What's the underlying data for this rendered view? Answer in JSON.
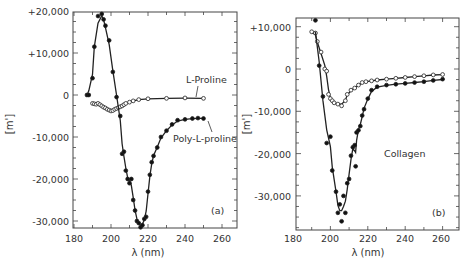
{
  "chart_data": [
    {
      "type": "line",
      "panel_label": "(a)",
      "title": "",
      "xlabel": "λ (nm)",
      "ylabel": "[m']",
      "xlim": [
        180,
        270
      ],
      "ylim": [
        -32000,
        20000
      ],
      "x_ticks": [
        180,
        200,
        220,
        240,
        260
      ],
      "x_tick_labels": [
        "180",
        "200",
        "220",
        "240",
        "260"
      ],
      "y_ticks": [
        20000,
        10000,
        0,
        -10000,
        -20000,
        -30000
      ],
      "y_tick_labels": [
        "+20,000",
        "+10,000",
        "0",
        "-10,000",
        "-20,000",
        "-30,000"
      ],
      "grid": false,
      "series": [
        {
          "name": "L-Proline",
          "marker": "open-circle",
          "x": [
            190,
            191,
            192,
            193,
            194,
            195,
            196,
            197,
            198,
            199,
            200,
            201,
            202,
            203,
            204,
            205,
            206,
            207,
            208,
            210,
            212,
            215,
            220,
            230,
            240,
            250
          ],
          "y": [
            -2000,
            -2100,
            -2200,
            -2000,
            -2300,
            -2600,
            -2900,
            -3100,
            -3400,
            -3600,
            -3800,
            -3700,
            -3400,
            -3200,
            -3000,
            -2800,
            -2600,
            -2300,
            -2000,
            -1700,
            -1400,
            -1100,
            -900,
            -800,
            -700,
            -800
          ]
        },
        {
          "name": "Poly-L-proline",
          "marker": "filled-circle",
          "x": [
            187,
            188,
            190,
            191,
            193,
            195,
            196,
            197,
            199,
            201,
            203,
            205,
            206,
            207,
            208,
            209,
            210,
            211,
            212,
            213,
            214,
            215,
            216,
            217,
            218,
            219,
            220,
            221,
            222,
            223,
            225,
            227,
            230,
            233,
            236,
            240,
            244,
            247,
            250
          ],
          "y": [
            0,
            0,
            4000,
            11500,
            18800,
            19300,
            18000,
            16500,
            13000,
            5500,
            -500,
            -5000,
            -14000,
            -13500,
            -18000,
            -20000,
            -21000,
            -20000,
            -25000,
            -27500,
            -30000,
            -30500,
            -31500,
            -31000,
            -29500,
            -29000,
            -23000,
            -19000,
            -16000,
            -14500,
            -12500,
            -10000,
            -8500,
            -7000,
            -6000,
            -5800,
            -5600,
            -5500,
            -5600
          ]
        }
      ],
      "annotations": [
        {
          "text": "L-Proline",
          "x": 250,
          "y": 4000
        },
        {
          "text": "Poly-L-proline",
          "x": 250,
          "y": -11000
        },
        {
          "text": "(a)",
          "x": 256,
          "y": -28000
        }
      ]
    },
    {
      "type": "line",
      "panel_label": "(b)",
      "title": "",
      "xlabel": "λ (nm)",
      "ylabel": "[m']",
      "xlim": [
        180,
        270
      ],
      "ylim": [
        -38000,
        12000
      ],
      "x_ticks": [
        180,
        200,
        220,
        240,
        260
      ],
      "x_tick_labels": [
        "180",
        "200",
        "220",
        "240",
        "260"
      ],
      "y_ticks": [
        10000,
        0,
        -10000,
        -20000,
        -30000
      ],
      "y_tick_labels": [
        "+10,000",
        "0",
        "-10,000",
        "-20,000",
        "-30,000"
      ],
      "grid": false,
      "series": [
        {
          "name": "Collagen (open circles)",
          "marker": "open-circle",
          "x": [
            190,
            192,
            193,
            195,
            197,
            198,
            199,
            200,
            201,
            202,
            204,
            206,
            208,
            209,
            211,
            213,
            215,
            217,
            219,
            222,
            225,
            230,
            235,
            240,
            245,
            250,
            255,
            260
          ],
          "y": [
            8800,
            8500,
            6500,
            4000,
            0,
            -500,
            -6000,
            -7000,
            -7500,
            -8000,
            -8300,
            -8700,
            -7500,
            -6000,
            -5000,
            -4500,
            -3800,
            -3200,
            -3000,
            -2800,
            -2600,
            -2400,
            -2200,
            -2000,
            -1800,
            -1600,
            -1400,
            -1300
          ]
        },
        {
          "name": "Collagen (filled circles)",
          "marker": "filled-circle",
          "x": [
            192,
            194,
            196,
            198,
            200,
            201,
            203,
            204,
            205,
            206,
            207,
            208,
            209,
            210,
            211,
            212,
            213,
            213.5,
            214,
            215,
            216,
            217,
            218,
            220,
            222,
            225,
            230,
            235,
            240,
            245,
            250,
            255,
            260
          ],
          "y": [
            11500,
            800,
            -6500,
            -17500,
            -16000,
            -24000,
            -29000,
            -34000,
            -32000,
            -36000,
            -30000,
            -34000,
            -27000,
            -26000,
            -20500,
            -18500,
            -18000,
            -23000,
            -15000,
            -14500,
            -13500,
            -11000,
            -9500,
            -7000,
            -5000,
            -4200,
            -3800,
            -3600,
            -3400,
            -3200,
            -3000,
            -2700,
            -2400
          ]
        }
      ],
      "annotations": [
        {
          "text": "Collagen",
          "x": 233,
          "y": -20000
        },
        {
          "text": "(b)",
          "x": 253,
          "y": -32000
        }
      ]
    }
  ],
  "panels": {
    "a": {
      "label": "(a)",
      "xlabel": "λ (nm)",
      "ylabel": "[m']",
      "x_tick_labels": [
        "180",
        "200",
        "220",
        "240",
        "260"
      ],
      "y_tick_labels": [
        "+20,000",
        "+10,000",
        "0",
        "-10,000",
        "-20,000",
        "-30,000"
      ],
      "annotation_1": "L-Proline",
      "annotation_2": "Poly-L-proline"
    },
    "b": {
      "label": "(b)",
      "xlabel": "λ (nm)",
      "ylabel": "[m']",
      "x_tick_labels": [
        "180",
        "200",
        "220",
        "240",
        "260"
      ],
      "y_tick_labels": [
        "+10,000",
        "0",
        "-10,000",
        "-20,000",
        "-30,000"
      ],
      "annotation_1": "Collagen"
    }
  }
}
